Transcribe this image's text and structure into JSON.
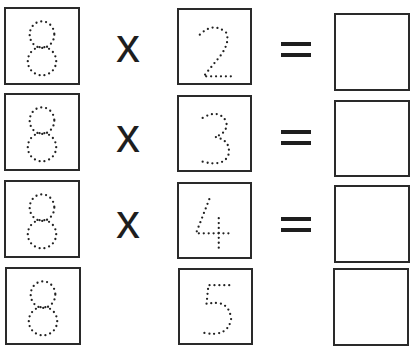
{
  "worksheet": {
    "operator_times": "x",
    "operator_equals": "=",
    "multiplicand": "8",
    "rows": [
      {
        "multiplicand": "8",
        "multiplier": "2",
        "answer": ""
      },
      {
        "multiplicand": "8",
        "multiplier": "3",
        "answer": ""
      },
      {
        "multiplicand": "8",
        "multiplier": "4",
        "answer": ""
      },
      {
        "multiplicand": "8",
        "multiplier": "5",
        "answer": ""
      }
    ],
    "style": {
      "digit_style": "dotted-tracing",
      "ink_color": "#2a2a2a",
      "background": "#ffffff"
    }
  }
}
